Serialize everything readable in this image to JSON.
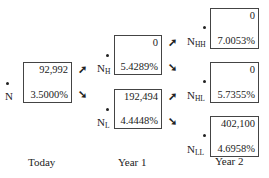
{
  "nodes": {
    "N": {
      "label": "N",
      "sub": "",
      "value": "92,992",
      "rate": "3.5000%"
    },
    "NH": {
      "label": "N",
      "sub": "H",
      "value": "0",
      "rate": "5.4289%"
    },
    "NL": {
      "label": "N",
      "sub": "L",
      "value": "192,494",
      "rate": "4.4448%"
    },
    "NHH": {
      "label": "N",
      "sub": "HH",
      "value": "0",
      "rate": "7.0053%"
    },
    "NHL": {
      "label": "N",
      "sub": "HL",
      "value": "0",
      "rate": "5.7355%"
    },
    "NLL": {
      "label": "N",
      "sub": "LL",
      "value": "402,100",
      "rate": "4.6958%"
    }
  },
  "arrows": {
    "up": "➚",
    "down": "➘"
  },
  "periods": [
    "Today",
    "Year 1",
    "Year 2"
  ]
}
